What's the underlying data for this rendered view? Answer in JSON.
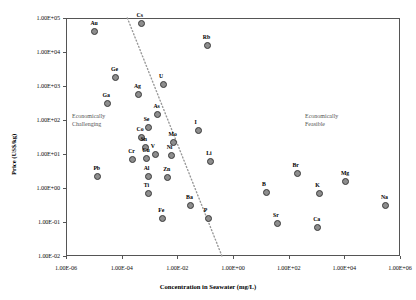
{
  "chart_data": {
    "type": "scatter",
    "title": "",
    "xlabel": "Concentration in Seawater (mg/L)",
    "ylabel": "Price (US$/kg)",
    "xscale": "log",
    "yscale": "log",
    "xlim": [
      1e-06,
      1000000.0
    ],
    "ylim": [
      0.01,
      100000.0
    ],
    "grid": false,
    "legend": null,
    "xticks": [
      "1.00E-06",
      "1.00E-04",
      "1.00E-02",
      "1.00E+00",
      "1.00E+02",
      "1.00E+04",
      "1.00E+06"
    ],
    "yticks": [
      "1.00E+05",
      "1.00E+04",
      "1.00E+03",
      "1.00E+02",
      "1.00E+01",
      "1.00E+00",
      "1.00E-01",
      "1.00E-02"
    ],
    "annotations": [
      {
        "text": "Economically Challenging",
        "line1": "Economically",
        "line2": "Challenging"
      },
      {
        "text": "Economically Feasible",
        "line1": "Economically",
        "line2": "Feasible"
      }
    ],
    "divider": {
      "type": "dotted-line",
      "from": [
        0.00016,
        100000.0
      ],
      "to": [
        0.4,
        0.01
      ]
    },
    "points": [
      {
        "label": "Au",
        "x": 1.1e-05,
        "y": 40000.0
      },
      {
        "label": "Cs",
        "x": 0.0005,
        "y": 70000.0
      },
      {
        "label": "Rb",
        "x": 0.12,
        "y": 16000.0
      },
      {
        "label": "Ge",
        "x": 6e-05,
        "y": 1800.0
      },
      {
        "label": "Ag",
        "x": 0.0004,
        "y": 550.0
      },
      {
        "label": "U",
        "x": 0.0032,
        "y": 1100.0
      },
      {
        "label": "Ga",
        "x": 3e-05,
        "y": 300.0
      },
      {
        "label": "As",
        "x": 0.002,
        "y": 150.0
      },
      {
        "label": "Se",
        "x": 0.0009,
        "y": 60.0
      },
      {
        "label": "Co",
        "x": 0.0005,
        "y": 30.0
      },
      {
        "label": "I",
        "x": 0.06,
        "y": 50.0
      },
      {
        "label": "Mo",
        "x": 0.007,
        "y": 22.0
      },
      {
        "label": "Sn",
        "x": 0.0007,
        "y": 16.0
      },
      {
        "label": "V",
        "x": 0.0016,
        "y": 10.0
      },
      {
        "label": "Ni",
        "x": 0.006,
        "y": 9.0
      },
      {
        "label": "Cu",
        "x": 0.0008,
        "y": 7.5
      },
      {
        "label": "Cr",
        "x": 0.00025,
        "y": 7.0
      },
      {
        "label": "Li",
        "x": 0.16,
        "y": 6.0
      },
      {
        "label": "Pb",
        "x": 1.4e-05,
        "y": 2.2
      },
      {
        "label": "Al",
        "x": 0.0009,
        "y": 2.2
      },
      {
        "label": "Zn",
        "x": 0.0045,
        "y": 2.0
      },
      {
        "label": "Br",
        "x": 200.0,
        "y": 2.6
      },
      {
        "label": "Mg",
        "x": 11000.0,
        "y": 1.6
      },
      {
        "label": "Ti",
        "x": 0.0009,
        "y": 0.7
      },
      {
        "label": "B",
        "x": 16.0,
        "y": 0.75
      },
      {
        "label": "K",
        "x": 1300.0,
        "y": 0.7
      },
      {
        "label": "Ba",
        "x": 0.03,
        "y": 0.3
      },
      {
        "label": "Na",
        "x": 300000.0,
        "y": 0.3
      },
      {
        "label": "Fe",
        "x": 0.003,
        "y": 0.13
      },
      {
        "label": "P",
        "x": 0.13,
        "y": 0.13
      },
      {
        "label": "Sr",
        "x": 40.0,
        "y": 0.09
      },
      {
        "label": "Ca",
        "x": 1100.0,
        "y": 0.07
      }
    ]
  }
}
